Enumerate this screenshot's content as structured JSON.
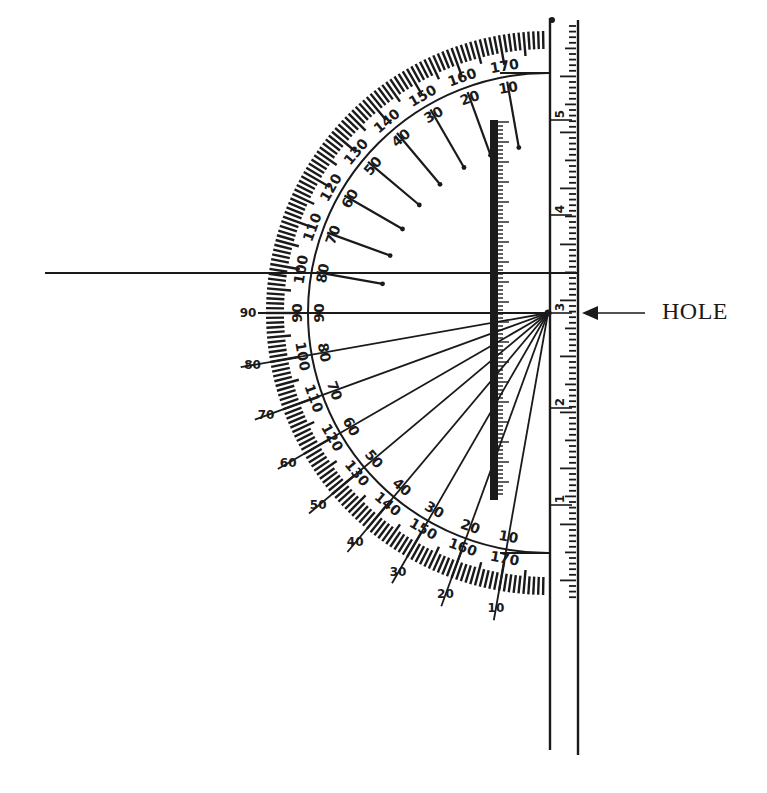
{
  "diagram": {
    "center": {
      "x": 548,
      "y": 313
    },
    "outer_radius": 282,
    "tick_inner_radius": 258,
    "inner_arc_radius": 240,
    "colors": {
      "ink": "#1a1a1a",
      "background": "#ffffff"
    },
    "callout": {
      "label": "HOLE",
      "pointer": "arrow-left"
    },
    "outer_scale_labels": [
      "10",
      "20",
      "30",
      "40",
      "50",
      "60",
      "70",
      "80",
      "90",
      "100",
      "110",
      "120",
      "130",
      "140",
      "150",
      "160",
      "170"
    ],
    "inner_scale_labels": [
      "170",
      "160",
      "150",
      "140",
      "130",
      "120",
      "110",
      "100",
      "90",
      "80",
      "70",
      "60",
      "50",
      "40",
      "30",
      "20",
      "10"
    ],
    "lower_outer_labels": [
      "90",
      "80",
      "70",
      "60",
      "50",
      "40",
      "30",
      "20",
      "10"
    ],
    "upper_outer_labels": [
      "100",
      "110",
      "120",
      "130",
      "140",
      "150",
      "160",
      "170"
    ],
    "upper_inner_labels": [
      "80",
      "70",
      "60",
      "50",
      "40",
      "30",
      "20",
      "10"
    ],
    "lower_inner_labels": [
      "90",
      "100",
      "110",
      "120",
      "130",
      "140",
      "150",
      "160",
      "170"
    ],
    "ruler": {
      "labels": [
        "5",
        "4",
        "3",
        "2",
        "1"
      ],
      "x_left": 550,
      "x_right": 578,
      "y_top": 18,
      "y_bottom": 600
    },
    "horizontal_line_y": 273
  }
}
